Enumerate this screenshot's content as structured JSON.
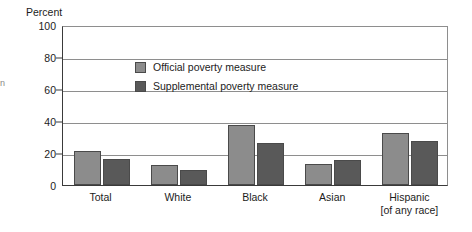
{
  "axis_title": "Percent",
  "edge_fragment": "n",
  "legend": [
    {
      "label": "Official poverty measure",
      "color": "#8c8c8c",
      "key": "official"
    },
    {
      "label": "Supplemental poverty measure",
      "color": "#595959",
      "key": "supplemental"
    }
  ],
  "chart_data": {
    "type": "bar",
    "title": "",
    "subtitle": "",
    "xlabel": "",
    "ylabel": "Percent",
    "ylim": [
      0,
      100
    ],
    "yticks": [
      0,
      20,
      40,
      60,
      80,
      100
    ],
    "ytick_labels": [
      "0",
      "20",
      "40",
      "60",
      "80",
      "100"
    ],
    "grid": "horizontal",
    "legend_position": "inside-top-left",
    "categories": [
      "Total",
      "White",
      "Black",
      "Asian",
      "Hispanic"
    ],
    "category_sublabels": [
      "",
      "",
      "",
      "",
      "[of any race]"
    ],
    "series": [
      {
        "name": "Official poverty measure",
        "color": "#8c8c8c",
        "values": [
          21.0,
          12.5,
          37.5,
          13.0,
          32.5
        ]
      },
      {
        "name": "Supplemental poverty measure",
        "color": "#595959",
        "values": [
          16.5,
          9.5,
          26.5,
          15.5,
          27.5
        ]
      }
    ]
  }
}
